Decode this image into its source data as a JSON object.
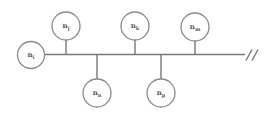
{
  "diagram": {
    "type": "bus-topology",
    "bus": {
      "y": 54.5,
      "x_start": 45,
      "x_end": 245,
      "break_mark": "//"
    },
    "colors": {
      "line": "#777777",
      "circle_stroke": "#8a8a8a",
      "label": "#555555",
      "background": "#ffffff"
    },
    "nodes": [
      {
        "id": "n_i",
        "base": "n",
        "sub": "i",
        "cx": 31,
        "cy": 55,
        "r": 13.5,
        "side": "end"
      },
      {
        "id": "n_j",
        "base": "n",
        "sub": "j",
        "cx": 66,
        "cy": 26,
        "r": 14,
        "side": "top"
      },
      {
        "id": "n_n",
        "base": "n",
        "sub": "n",
        "cx": 97,
        "cy": 93,
        "r": 14,
        "side": "bottom"
      },
      {
        "id": "n_k",
        "base": "n",
        "sub": "k",
        "cx": 135,
        "cy": 26,
        "r": 14,
        "side": "top"
      },
      {
        "id": "n_p",
        "base": "n",
        "sub": "p",
        "cx": 161,
        "cy": 93,
        "r": 14,
        "side": "bottom"
      },
      {
        "id": "n_m",
        "base": "n",
        "sub": "m",
        "cx": 195,
        "cy": 27,
        "r": 14,
        "side": "top"
      }
    ]
  }
}
